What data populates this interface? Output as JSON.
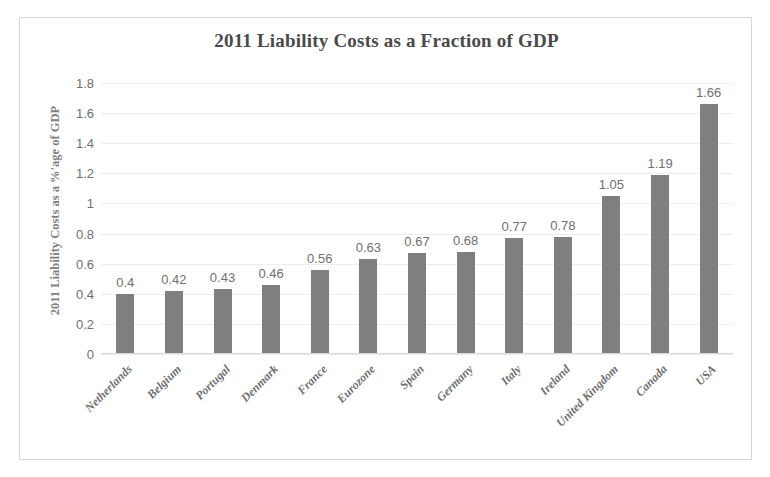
{
  "chart_data": {
    "type": "bar",
    "title": "2011 Liability Costs as a Fraction of GDP",
    "xlabel": "",
    "ylabel": "2011 Liability  Costs as a %'age of GDP",
    "categories": [
      "Netherlands",
      "Belgium",
      "Portugal",
      "Denmark",
      "France",
      "Eurozone",
      "Spain",
      "Germany",
      "Italy",
      "Ireland",
      "United Kingdom",
      "Canada",
      "USA"
    ],
    "values": [
      0.4,
      0.42,
      0.43,
      0.46,
      0.56,
      0.63,
      0.67,
      0.68,
      0.77,
      0.78,
      1.05,
      1.19,
      1.66
    ],
    "value_labels": [
      "0.4",
      "0.42",
      "0.43",
      "0.46",
      "0.56",
      "0.63",
      "0.67",
      "0.68",
      "0.77",
      "0.78",
      "1.05",
      "1.19",
      "1.66"
    ],
    "ylim": [
      0,
      1.8
    ],
    "ytick_values": [
      0,
      0.2,
      0.4,
      0.6,
      0.8,
      1,
      1.2,
      1.4,
      1.6,
      1.8
    ],
    "ytick_labels": [
      "0",
      "0.2",
      "0.4",
      "0.6",
      "0.8",
      "1",
      "1.2",
      "1.4",
      "1.6",
      "1.8"
    ],
    "grid": true,
    "legend": false,
    "bar_color": "#7f7f7f",
    "gridline_color": "#ededed",
    "text_color": "#6f6f6f",
    "border_color": "#d8d8d8",
    "background_color": "#ffffff"
  }
}
